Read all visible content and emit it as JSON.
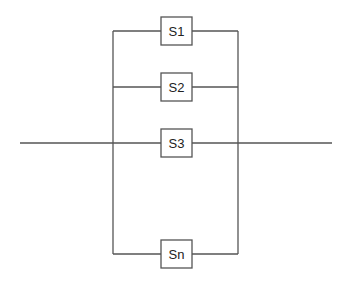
{
  "diagram": {
    "type": "parallel-system-block-diagram",
    "colors": {
      "line": "#555555",
      "text": "#222222",
      "background": "#ffffff"
    },
    "components": [
      {
        "id": "s1",
        "label": "S1"
      },
      {
        "id": "s2",
        "label": "S2"
      },
      {
        "id": "s3",
        "label": "S3"
      },
      {
        "id": "sn",
        "label": "Sn"
      }
    ]
  }
}
